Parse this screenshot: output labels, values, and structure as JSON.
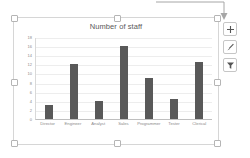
{
  "chart_data": {
    "type": "bar",
    "title": "Number of staff",
    "xlabel": "",
    "ylabel": "",
    "categories": [
      "Director",
      "Engineer",
      "Analyst",
      "Sales",
      "Programmer",
      "Tester",
      "Clerical"
    ],
    "values": [
      3,
      12,
      4,
      16,
      9,
      4.5,
      12.5
    ],
    "ylim": [
      0,
      18
    ],
    "yticks": [
      18,
      16,
      14,
      12,
      10,
      8,
      6,
      4,
      2,
      0
    ],
    "grid": true,
    "legend": "none",
    "series_color": "#595959",
    "gridline_color": "#ededed"
  },
  "chart_object": {
    "selected": true,
    "handle_name": "resize-handle"
  },
  "side_buttons": [
    {
      "icon": "plus-icon",
      "name": "chart-elements-button",
      "glyph": "+"
    },
    {
      "icon": "brush-icon",
      "name": "chart-styles-button",
      "glyph": "/"
    },
    {
      "icon": "funnel-icon",
      "name": "chart-filters-button",
      "glyph": "T"
    }
  ],
  "callout": {
    "name": "callout-arrow",
    "points_to": "chart-elements-button"
  }
}
